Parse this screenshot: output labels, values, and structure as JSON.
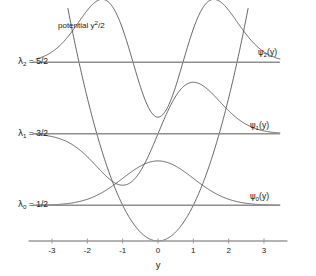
{
  "figure": {
    "title": "",
    "background_color": "#ffffff",
    "line_color": "#555555",
    "axis_color": "#999999",
    "text_color": "#1a1a1a"
  },
  "annotations": {
    "potential_label": "potential y2/2",
    "potential_label_parts": {
      "text": "potential y",
      "sup": "2",
      "tail": "/2"
    },
    "axis_title": "y"
  },
  "levels": [
    {
      "name": "lambda0",
      "symbol": "λ",
      "subscript": "0",
      "equals": "=",
      "value_text": "1/2",
      "value": 0.5,
      "label": "λ0 = 1/2"
    },
    {
      "name": "lambda1",
      "symbol": "λ",
      "subscript": "1",
      "equals": "=",
      "value_text": "3/2",
      "value": 1.5,
      "label": "λ1 = 3/2"
    },
    {
      "name": "lambda2",
      "symbol": "λ",
      "subscript": "2",
      "equals": "=",
      "value_text": "5/2",
      "value": 2.5,
      "label": "λ2 = 5/2"
    }
  ],
  "wavefunction_labels": [
    {
      "name": "psi0",
      "symbol": "ψ",
      "subscript": "0",
      "arg": "(y)",
      "label": "ψ0(y)"
    },
    {
      "name": "psi1",
      "symbol": "ψ",
      "subscript": "1",
      "arg": "(y)",
      "label": "ψ1(y)"
    },
    {
      "name": "psi2",
      "symbol": "ψ",
      "subscript": "2",
      "arg": "(y)",
      "label": "ψ2(y)"
    }
  ],
  "chart_data": {
    "type": "line",
    "title": "",
    "xlabel": "y",
    "ylabel": "",
    "xlim": [
      -3.55,
      3.55
    ],
    "ylim": [
      -0.07,
      3.45
    ],
    "xticks": [
      -3,
      -2,
      -1,
      0,
      1,
      2,
      3
    ],
    "xtick_labels": [
      "-3",
      "-2",
      "-1",
      "0",
      "1",
      "2",
      "3"
    ],
    "yticks": [],
    "ytick_labels": [],
    "grid": false,
    "legend": "none",
    "series": [
      {
        "name": "potential",
        "kind": "parabola",
        "expression": "y^2/2",
        "label": "potential y2/2",
        "x": [
          -3.0,
          -2.5,
          -2.0,
          -1.5,
          -1.0,
          -0.5,
          0.0,
          0.5,
          1.0,
          1.5,
          2.0,
          2.5,
          3.0
        ],
        "values": [
          4.5,
          3.125,
          2.0,
          1.125,
          0.5,
          0.125,
          0.0,
          0.125,
          0.5,
          1.125,
          2.0,
          3.125,
          4.5
        ]
      },
      {
        "name": "level-0",
        "kind": "energy-level",
        "label": "λ0 = 1/2",
        "y": 0.5,
        "x_range": [
          -3.55,
          3.45
        ]
      },
      {
        "name": "level-1",
        "kind": "energy-level",
        "label": "λ1 = 3/2",
        "y": 1.5,
        "x_range": [
          -3.55,
          3.45
        ]
      },
      {
        "name": "level-2",
        "kind": "energy-level",
        "label": "λ2 = 5/2",
        "y": 2.5,
        "x_range": [
          -3.55,
          3.45
        ]
      },
      {
        "name": "psi-0",
        "kind": "wavefunction",
        "label": "ψ0(y)",
        "baseline": 0.5,
        "amplitude": 0.62,
        "hermite_n": 0,
        "x": [
          -3.4,
          -3.0,
          -2.6,
          -2.2,
          -1.8,
          -1.4,
          -1.0,
          -0.6,
          -0.2,
          0.0,
          0.2,
          0.6,
          1.0,
          1.4,
          1.8,
          2.2,
          2.6,
          3.0,
          3.4
        ],
        "values": [
          0.503,
          0.513,
          0.538,
          0.586,
          0.665,
          0.777,
          0.906,
          1.019,
          1.082,
          1.087,
          1.082,
          1.019,
          0.906,
          0.777,
          0.665,
          0.586,
          0.538,
          0.513,
          0.503
        ]
      },
      {
        "name": "psi-1",
        "kind": "wavefunction",
        "label": "ψ1(y)",
        "baseline": 1.5,
        "amplitude": 0.72,
        "hermite_n": 1,
        "x": [
          -3.4,
          -3.0,
          -2.6,
          -2.2,
          -1.8,
          -1.4,
          -1.0,
          -0.6,
          -0.2,
          0.0,
          0.2,
          0.6,
          1.0,
          1.4,
          1.8,
          2.2,
          2.6,
          3.0,
          3.4
        ],
        "values": [
          1.479,
          1.443,
          1.382,
          1.296,
          1.205,
          1.153,
          1.165,
          1.262,
          1.42,
          1.5,
          1.58,
          1.738,
          1.835,
          1.847,
          1.795,
          1.704,
          1.618,
          1.557,
          1.521
        ]
      },
      {
        "name": "psi-2",
        "kind": "wavefunction",
        "label": "ψ2(y)",
        "baseline": 2.5,
        "amplitude": 0.88,
        "hermite_n": 2,
        "x": [
          -3.4,
          -3.0,
          -2.6,
          -2.2,
          -1.8,
          -1.4,
          -1.0,
          -0.6,
          -0.2,
          0.0,
          0.2,
          0.6,
          1.0,
          1.4,
          1.8,
          2.2,
          2.6,
          3.0,
          3.4
        ],
        "values": [
          2.545,
          2.64,
          2.813,
          2.992,
          3.085,
          3.05,
          2.898,
          2.686,
          2.512,
          2.455,
          2.512,
          2.686,
          2.898,
          3.05,
          3.085,
          2.992,
          2.813,
          2.64,
          2.545
        ]
      }
    ]
  }
}
